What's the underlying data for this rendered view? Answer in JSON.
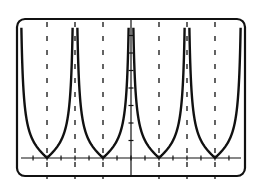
{
  "chart_data": {
    "type": "line",
    "title": "",
    "xlabel": "",
    "ylabel": "",
    "function": "y = |cot x|",
    "x_window": [
      -4.712,
      4.712
    ],
    "x_tick_step": 0.785,
    "y_tick_step": 1,
    "y_window": [
      -1,
      8
    ],
    "asymptotes_x": [
      -4.712,
      -3.1416,
      -1.5708,
      0,
      1.5708,
      3.1416,
      4.712
    ],
    "asymptote_style": "dashed",
    "zeros_x": [
      -3.927,
      -2.356,
      -0.785,
      0.785,
      2.356,
      3.927
    ],
    "grid": false,
    "legend": null,
    "color": "#111111"
  },
  "frame": {
    "border_color": "#111111",
    "background": "#ffffff",
    "corner_radius": 8
  }
}
